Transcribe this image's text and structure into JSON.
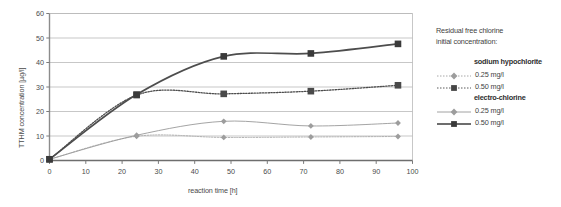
{
  "chart_data": {
    "type": "line",
    "title": "",
    "xlabel": "reaction time [h]",
    "ylabel": "TTHM concentration [µg/l]",
    "xlim": [
      0,
      100
    ],
    "ylim": [
      0,
      60
    ],
    "xticks": [
      "0",
      "10",
      "20",
      "30",
      "40",
      "50",
      "60",
      "70",
      "80",
      "90",
      "100"
    ],
    "yticks": [
      "0",
      "10",
      "20",
      "30",
      "40",
      "50",
      "60"
    ],
    "grid": "horizontal",
    "legend_position": "right",
    "x": [
      0,
      24,
      48,
      72,
      96
    ],
    "series": [
      {
        "name": "sodium hypochlorite 0.25 mg/l",
        "group": "sodium hypochlorite",
        "concentration": "0.25 mg/l",
        "values": [
          0.5,
          9.9,
          9.4,
          9.6,
          9.8
        ],
        "color": "#a8a8a8",
        "style": "dotted",
        "marker": "diamond"
      },
      {
        "name": "sodium hypochlorite 0.50 mg/l",
        "group": "sodium hypochlorite",
        "concentration": "0.50 mg/l",
        "values": [
          0.5,
          26.7,
          27.2,
          28.3,
          30.7
        ],
        "color": "#4d4d4d",
        "style": "dotted",
        "marker": "square"
      },
      {
        "name": "electro-chlorine 0.25 mg/l",
        "group": "electro-chlorine",
        "concentration": "0.25 mg/l",
        "values": [
          0.5,
          10.3,
          16.0,
          14.1,
          15.3
        ],
        "color": "#9a9a9a",
        "style": "solid",
        "marker": "diamond"
      },
      {
        "name": "electro-chlorine 0.50 mg/l",
        "group": "electro-chlorine",
        "concentration": "0.50 mg/l",
        "values": [
          0.5,
          26.9,
          42.5,
          43.7,
          47.6
        ],
        "color": "#4d4d4d",
        "style": "solid",
        "marker": "square"
      }
    ]
  },
  "legend": {
    "title_line1": "Residual free chlorine",
    "title_line2": "initial concentration:",
    "groups": [
      {
        "heading": "sodium hypochlorite",
        "entries": [
          {
            "label": "0.25 mg/l"
          },
          {
            "label": "0.50 mg/l"
          }
        ]
      },
      {
        "heading": "electro-chlorine",
        "entries": [
          {
            "label": "0.25 mg/l"
          },
          {
            "label": "0.50 mg/l"
          }
        ]
      }
    ]
  }
}
